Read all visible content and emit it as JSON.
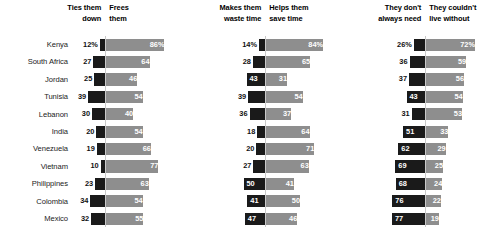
{
  "chart_data": {
    "type": "bar",
    "subtype": "diverging-stacked-bar-panels",
    "title": "",
    "subtitle": "",
    "xlabel": "",
    "ylabel": "",
    "xlim": [
      0,
      100
    ],
    "grid": false,
    "legend_position": "column-headers",
    "value_suffix_first_row": "%",
    "categories": [
      "Kenya",
      "South Africa",
      "Jordan",
      "Tunisia",
      "Lebanon",
      "India",
      "Venezuela",
      "Vietnam",
      "Philippines",
      "Colombia",
      "Mexico"
    ],
    "panels": [
      {
        "id": "time-freedom",
        "left_label": "Ties them\ndown",
        "right_label": "Frees\nthem",
        "left_series_name": "Ties them down",
        "right_series_name": "Frees them",
        "left_values": [
          12,
          27,
          25,
          39,
          30,
          20,
          19,
          10,
          23,
          34,
          32
        ],
        "right_values": [
          86,
          64,
          46,
          54,
          40,
          54,
          66,
          77,
          63,
          54,
          55
        ]
      },
      {
        "id": "time-use",
        "left_label": "Makes them\nwaste time",
        "right_label": "Helps them\nsave time",
        "left_series_name": "Makes them waste time",
        "right_series_name": "Helps them save time",
        "left_values": [
          14,
          28,
          43,
          39,
          36,
          18,
          20,
          27,
          50,
          41,
          47
        ],
        "right_values": [
          84,
          65,
          31,
          54,
          37,
          64,
          71,
          63,
          41,
          50,
          46
        ]
      },
      {
        "id": "necessity",
        "left_label": "They don't\nalways need",
        "right_label": "They couldn't\nlive without",
        "left_series_name": "They don't always need",
        "right_series_name": "They couldn't live without",
        "left_values": [
          26,
          36,
          37,
          43,
          31,
          51,
          62,
          69,
          68,
          76,
          77
        ],
        "right_values": [
          72,
          59,
          56,
          54,
          53,
          33,
          29,
          25,
          24,
          22,
          19
        ]
      }
    ],
    "colors": {
      "left_bar": "#1a1a1a",
      "right_bar": "#8e8e8e",
      "axis_line": "#c9c9c9",
      "label_text": "#222222",
      "value_text_inside": "#ffffff",
      "value_text_outside": "#111111",
      "background": "#ffffff"
    }
  }
}
